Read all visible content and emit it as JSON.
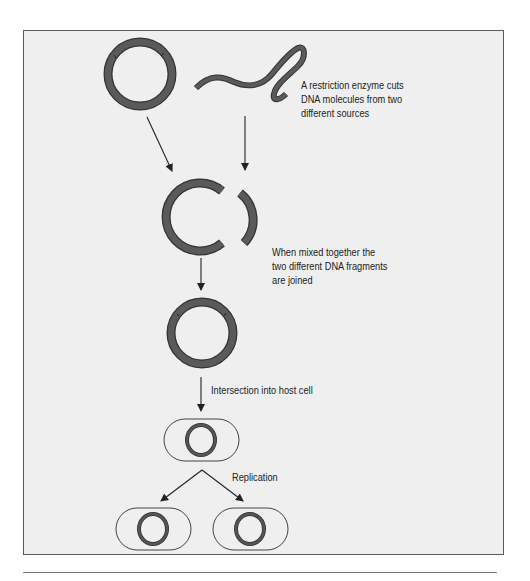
{
  "figure": {
    "type": "recombinant-dna-process",
    "colors": {
      "background": "#efefef",
      "border": "#5a5a5a",
      "dna_fill": "#555555",
      "dna_outline": "#333333",
      "arrow": "#222222",
      "text": "#222222"
    },
    "steps": [
      {
        "id": "cut",
        "lines": [
          "A restriction enzyme cuts",
          "DNA molecules from two",
          "different sources"
        ]
      },
      {
        "id": "join",
        "lines": [
          "When mixed together the",
          "two different DNA fragments",
          "are joined"
        ]
      },
      {
        "id": "insert",
        "lines": [
          "Intersection into host cell"
        ]
      },
      {
        "id": "replicate",
        "lines": [
          "Replication"
        ]
      }
    ],
    "nodes": [
      {
        "name": "plasmid-circle",
        "shape": "ring"
      },
      {
        "name": "foreign-dna-strand",
        "shape": "squiggle"
      },
      {
        "name": "cut-plasmid",
        "shape": "open-ring"
      },
      {
        "name": "foreign-dna-fragment",
        "shape": "arc"
      },
      {
        "name": "recombinant-plasmid",
        "shape": "ring"
      },
      {
        "name": "host-cell",
        "shape": "capsule-with-ring"
      },
      {
        "name": "daughter-cell-left",
        "shape": "capsule-with-ring"
      },
      {
        "name": "daughter-cell-right",
        "shape": "capsule-with-ring"
      }
    ]
  }
}
